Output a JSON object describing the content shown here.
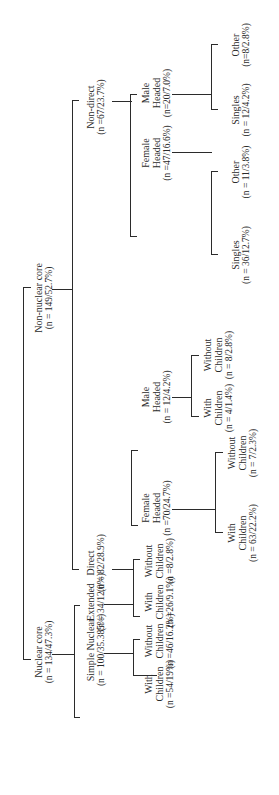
{
  "diagram": {
    "type": "tree",
    "orientation": "rotated-90-ccw",
    "nodes": {
      "root": {
        "label": "",
        "stat": ""
      },
      "nuclear_core": {
        "label": "Nuclear core",
        "stat": "(n = 134/47.3%)"
      },
      "non_nuclear_core": {
        "label": "Non-nuclear core",
        "stat": "(n = 149/52.7%)"
      },
      "simple_nuclear": {
        "label": "Simple Nuclear",
        "stat": "(n = 100/35.385%)"
      },
      "extended": {
        "label": "Extended",
        "stat": "(n = 34/12.0%)"
      },
      "sn_with_children": {
        "label1": "With",
        "label2": "Children",
        "stat": "(n =54/19%)"
      },
      "sn_without_children": {
        "label1": "Without",
        "label2": "Children",
        "stat": "(n =46/16.2%)"
      },
      "ext_with_children": {
        "label1": "With",
        "label2": "Children",
        "stat": "(n =26/9.1%)"
      },
      "ext_without_children": {
        "label1": "Without",
        "label2": "Children",
        "stat": "(n =8/2.8%)"
      },
      "direct": {
        "label": "Direct",
        "stat": "(n = 82/28.9%)"
      },
      "non_direct": {
        "label": "Non-direct",
        "stat": "(n =67/23.7%)"
      },
      "direct_female_headed": {
        "label1": "Female",
        "label2": "Headed",
        "stat": "(n =70/24.7%)"
      },
      "direct_male_headed": {
        "label1": "Male",
        "label2": "Headed",
        "stat": "(n = 12/4.2%)"
      },
      "dfh_with_children": {
        "label1": "With",
        "label2": "Children",
        "stat": "(n = 63/22.2%)"
      },
      "dfh_without_children": {
        "label1": "Without",
        "label2": "Children",
        "stat": "(n = 7/2.3%)"
      },
      "dmh_with_children": {
        "label1": "With",
        "label2": "Children",
        "stat": "(n = 4/1.4%)"
      },
      "dmh_without_children": {
        "label1": "Without",
        "label2": "Children",
        "stat": "(n = 8/2.8%)"
      },
      "nd_female_headed": {
        "label1": "Female",
        "label2": "Headed",
        "stat": "(n =47/16.6%)"
      },
      "nd_male_headed": {
        "label1": "Male",
        "label2": "Headed",
        "stat": "(n=20/7.0%)"
      },
      "ndf_singles": {
        "label": "Singles",
        "stat": "(n = 36/12.7%)"
      },
      "ndf_other": {
        "label": "Other",
        "stat": "(n = 11/3.8%)"
      },
      "ndm_singles": {
        "label": "Singles",
        "stat": "(n = 12/4.2%)"
      },
      "ndm_other": {
        "label": "Other",
        "stat": "(n=8/2.8%)"
      }
    },
    "colors": {
      "line": "#2b2b2b",
      "text": "#2a2a2a",
      "background": "#ffffff"
    }
  }
}
